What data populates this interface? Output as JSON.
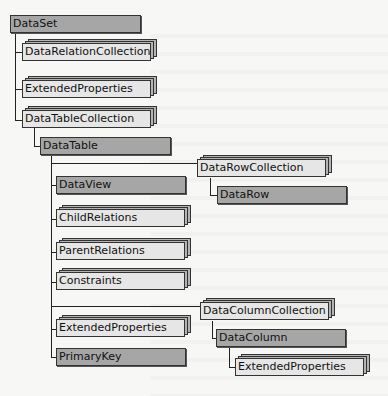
{
  "diagram": {
    "nodes": {
      "dataset": "DataSet",
      "data_relation_collection": "DataRelationCollection",
      "dataset_extended_properties": "ExtendedProperties",
      "data_table_collection": "DataTableCollection",
      "data_table": "DataTable",
      "data_view": "DataView",
      "child_relations": "ChildRelations",
      "parent_relations": "ParentRelations",
      "constraints": "Constraints",
      "table_extended_properties": "ExtendedProperties",
      "primary_key": "PrimaryKey",
      "data_row_collection": "DataRowCollection",
      "data_row": "DataRow",
      "data_column_collection": "DataColumnCollection",
      "data_column": "DataColumn",
      "column_extended_properties": "ExtendedProperties"
    },
    "legend": {
      "solid_box": "object",
      "stacked_box": "collection"
    },
    "colors": {
      "object_fill": "#a6a6a6",
      "collection_fill": "#e6e6e6",
      "collection_stack": "#b4b4b4",
      "line": "#222222"
    }
  }
}
